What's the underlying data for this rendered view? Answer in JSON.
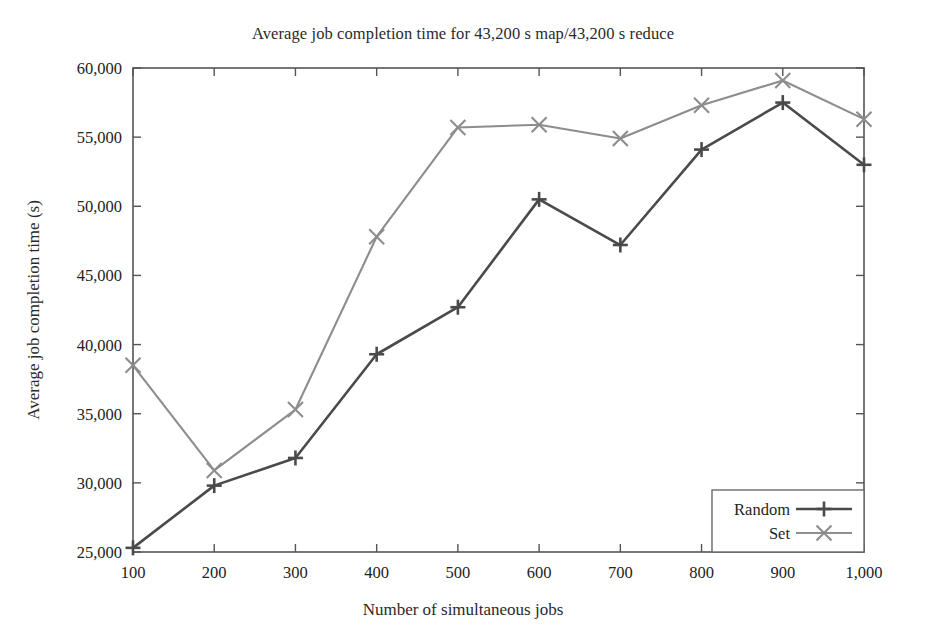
{
  "chart_data": {
    "type": "line",
    "title": "Average job completion time for 43,200 s map/43,200 s reduce",
    "xlabel": "Number of simultaneous jobs",
    "ylabel": "Average job completion time (s)",
    "x": [
      100,
      200,
      300,
      400,
      500,
      600,
      700,
      800,
      900,
      1000
    ],
    "xtick_labels": [
      "100",
      "200",
      "300",
      "400",
      "500",
      "600",
      "700",
      "800",
      "900",
      "1,000"
    ],
    "ytick_labels": [
      "25,000",
      "30,000",
      "35,000",
      "40,000",
      "45,000",
      "50,000",
      "55,000",
      "60,000"
    ],
    "yticks": [
      25000,
      30000,
      35000,
      40000,
      45000,
      50000,
      55000,
      60000
    ],
    "xlim": [
      100,
      1000
    ],
    "ylim": [
      25000,
      60000
    ],
    "grid": false,
    "legend_position": "bottom-right",
    "series": [
      {
        "name": "Random",
        "marker": "plus",
        "color": "#4a4a4a",
        "values": [
          25300,
          29800,
          31800,
          39300,
          42700,
          50500,
          47200,
          54100,
          57500,
          53000
        ]
      },
      {
        "name": "Set",
        "marker": "x",
        "color": "#8d8d8d",
        "values": [
          38500,
          30900,
          35300,
          47800,
          55700,
          55900,
          54900,
          57300,
          59100,
          56300
        ]
      }
    ]
  }
}
